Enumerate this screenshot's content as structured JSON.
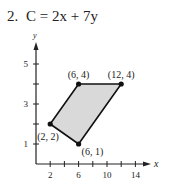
{
  "problem": {
    "number": "2.",
    "objective": "C = 2x + 7y"
  },
  "chart_data": {
    "type": "area",
    "xlabel": "x",
    "ylabel": "y",
    "x_ticks": [
      2,
      4,
      6,
      8,
      10,
      12,
      14
    ],
    "x_tick_labels": [
      "2",
      "6",
      "10",
      "14"
    ],
    "y_ticks": [
      1,
      2,
      3,
      4,
      5
    ],
    "y_tick_labels": [
      "1",
      "3",
      "5"
    ],
    "xlim": [
      0,
      16
    ],
    "ylim": [
      0,
      6
    ],
    "grid": false,
    "polygon": [
      {
        "x": 2,
        "y": 2,
        "label": "(2, 2)"
      },
      {
        "x": 6,
        "y": 4,
        "label": "(6, 4)"
      },
      {
        "x": 12,
        "y": 4,
        "label": "(12, 4)"
      },
      {
        "x": 6,
        "y": 1,
        "label": "(6, 1)"
      }
    ],
    "fill_color": "#d9d9d9",
    "edge_color": "#111111"
  }
}
